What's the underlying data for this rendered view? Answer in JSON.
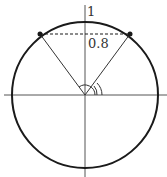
{
  "diagram": {
    "type": "unit-circle",
    "labels": {
      "top": "1",
      "chord": "0.8"
    },
    "geometry": {
      "center": [
        85,
        95
      ],
      "radius": 73,
      "point_left": [
        40,
        34
      ],
      "point_right": [
        130,
        34
      ]
    },
    "colors": {
      "stroke": "#1a1a1a",
      "axis": "#555555",
      "text": "#333333"
    }
  }
}
